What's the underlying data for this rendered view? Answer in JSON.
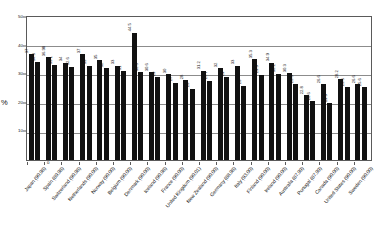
{
  "chart_data": {
    "type": "bar",
    "title": "",
    "xlabel": "",
    "ylabel": "%",
    "ylim": [
      0,
      50
    ],
    "yticks": [
      0,
      10,
      20,
      30,
      40,
      50
    ],
    "grid": true,
    "legend": "none",
    "categories": [
      "Japan (90.98)",
      "Spain (89.98)",
      "Switzerland (90.98)",
      "Netherlands (90.00)",
      "Norway (90.00)",
      "Belgium (90.00)",
      "Denmark (90.00)",
      "Iceland (90.98)",
      "France (90.00)",
      "United Kingdom (90.01)",
      "New Zealand (90.00)",
      "Germany (88.98)",
      "Italy (93.00)",
      "Finland (90.00)",
      "Ireland (90.00)",
      "Australia (87.99)",
      "Portugal (87.99)",
      "Canada (90.00)",
      "United States (90.00)",
      "Sweden (90.00)"
    ],
    "series": [
      {
        "name": "Series 1",
        "values": [
          37,
          36,
          34,
          37,
          35,
          33,
          44.5,
          30.6,
          30,
          28,
          31.2,
          32,
          33,
          35.3,
          34,
          30.3,
          22.8,
          26.6,
          28.2,
          26.6
        ]
      },
      {
        "name": "Series 2",
        "values": [
          34.3,
          33.1,
          32.6,
          33,
          32,
          31,
          30.6,
          29,
          27,
          25,
          27.7,
          29,
          26,
          29.9,
          30.2,
          26.6,
          20.6,
          19.9,
          25.6,
          25.6
        ]
      }
    ],
    "bar_labels": [
      [
        "37",
        "34.3"
      ],
      [
        "36.98",
        "33.1"
      ],
      [
        "34",
        "32.6"
      ],
      [
        "37",
        "33"
      ],
      [
        "35",
        "32"
      ],
      [
        "33",
        "31"
      ],
      [
        "44.5",
        "30.6"
      ],
      [
        "30.6",
        "29"
      ],
      [
        "30",
        "27"
      ],
      [
        "28",
        "25"
      ],
      [
        "31.2",
        "27.7"
      ],
      [
        "32",
        "29"
      ],
      [
        "33",
        "26"
      ],
      [
        "35.3",
        "29.9"
      ],
      [
        "34.9",
        "30.2"
      ],
      [
        "30.3",
        "26.6"
      ],
      [
        "22.8",
        "20.6"
      ],
      [
        "26.6",
        "19.9"
      ],
      [
        "28.2",
        "25.6"
      ],
      [
        "26.6",
        "25.6"
      ]
    ]
  }
}
